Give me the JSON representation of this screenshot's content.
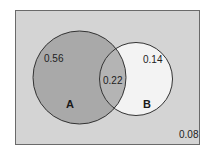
{
  "diagram": {
    "type": "venn",
    "colors": {
      "page_background": "#ffffff",
      "universe_fill": "#d4d4d4",
      "universe_border": "#6a6a6a",
      "set_a_fill": "#a9a9a9",
      "set_b_fill": "#f3f3f3",
      "intersection_fill": "#b4b4b4",
      "circle_stroke": "#333333"
    },
    "universe": {
      "outside_value": "0.08"
    },
    "sets": [
      {
        "name": "A",
        "only_value": "0.56"
      },
      {
        "name": "B",
        "only_value": "0.14"
      }
    ],
    "intersection": {
      "value": "0.22"
    }
  }
}
